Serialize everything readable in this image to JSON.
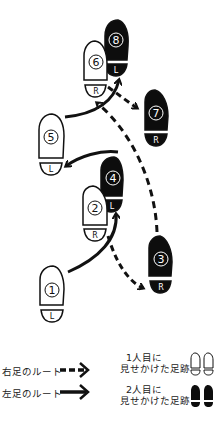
{
  "diagram": {
    "type": "footprint-route",
    "colors": {
      "stroke": "#111111",
      "dark_fill": "#0d0d0d",
      "light_fill": "#ffffff",
      "dark_text": "#ffffff",
      "light_text": "#111111"
    },
    "footprints": [
      {
        "step": "8",
        "foot": "L",
        "style": "dark"
      },
      {
        "step": "6",
        "foot": "R",
        "style": "light"
      },
      {
        "step": "7",
        "foot": "R",
        "style": "dark"
      },
      {
        "step": "5",
        "foot": "L",
        "style": "light"
      },
      {
        "step": "4",
        "foot": "L",
        "style": "dark"
      },
      {
        "step": "2",
        "foot": "R",
        "style": "light"
      },
      {
        "step": "3",
        "foot": "R",
        "style": "dark"
      },
      {
        "step": "1",
        "foot": "L",
        "style": "light"
      }
    ]
  },
  "legend": {
    "right_foot_route": "右足のルート",
    "left_foot_route": "左足のルート",
    "first_person_line1": "1人目に",
    "first_person_line2": "見せかけた足跡",
    "second_person_line1": "2人目に",
    "second_person_line2": "見せかけた足跡"
  }
}
